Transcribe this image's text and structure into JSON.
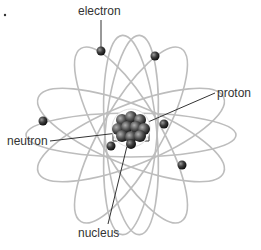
{
  "diagram": {
    "labels": {
      "electron": "electron",
      "proton": "proton",
      "neutron": "neutron",
      "nucleus": "nucleus"
    },
    "colors": {
      "orbit": "#bdbdbd",
      "particle": "#2f2f2f",
      "leader_line": "#333333",
      "text": "#333333"
    }
  }
}
